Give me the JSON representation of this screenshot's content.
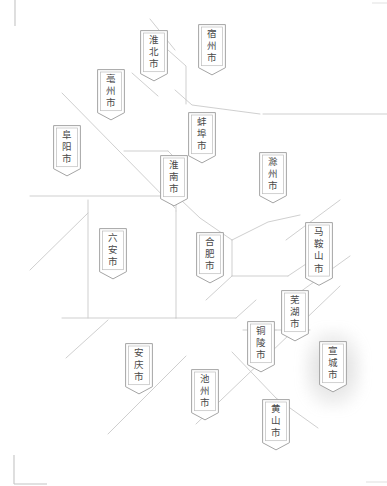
{
  "map": {
    "title": "安徽省",
    "region_name_en": "Anhui Province",
    "background_color": "#ffffff",
    "boundary_line_color": "#c9c9c9",
    "marker_border_color": "#9a9a9a",
    "marker_inner_border_color": "#bdbdbd",
    "marker_fill_color": "#ffffff",
    "label_text_color": "#4a4a4a",
    "highlight_glow_color": "#8a8a8a",
    "crop_mark_color": "#c4c4c4",
    "width": 387,
    "height": 486
  },
  "cities": [
    {
      "id": "huaibei",
      "label": "淮\n北\n市",
      "chars": 3,
      "x": 140,
      "y": 30,
      "highlighted": false
    },
    {
      "id": "suzhou",
      "label": "宿\n州\n市",
      "chars": 3,
      "x": 198,
      "y": 24,
      "highlighted": false
    },
    {
      "id": "bozhou",
      "label": "亳\n州\n市",
      "chars": 3,
      "x": 97,
      "y": 69,
      "highlighted": false
    },
    {
      "id": "bengbu",
      "label": "蚌\n埠\n市",
      "chars": 3,
      "x": 188,
      "y": 112,
      "highlighted": false
    },
    {
      "id": "fuyang",
      "label": "阜\n阳\n市",
      "chars": 3,
      "x": 53,
      "y": 125,
      "highlighted": false
    },
    {
      "id": "chuzhou",
      "label": "滁\n州\n市",
      "chars": 3,
      "x": 259,
      "y": 152,
      "highlighted": false
    },
    {
      "id": "huainan",
      "label": "淮\n南\n市",
      "chars": 3,
      "x": 160,
      "y": 155,
      "highlighted": false
    },
    {
      "id": "maanshan",
      "label": "马\n鞍\n山\n市",
      "chars": 4,
      "x": 305,
      "y": 222,
      "highlighted": false
    },
    {
      "id": "luan",
      "label": "六\n安\n市",
      "chars": 3,
      "x": 99,
      "y": 228,
      "highlighted": false
    },
    {
      "id": "hefei",
      "label": "合\n肥\n市",
      "chars": 3,
      "x": 196,
      "y": 232,
      "highlighted": false
    },
    {
      "id": "wuhu",
      "label": "芜\n湖\n市",
      "chars": 3,
      "x": 281,
      "y": 290,
      "highlighted": false
    },
    {
      "id": "tongling",
      "label": "铜\n陵\n市",
      "chars": 3,
      "x": 247,
      "y": 321,
      "highlighted": false
    },
    {
      "id": "anqing",
      "label": "安\n庆\n市",
      "chars": 3,
      "x": 125,
      "y": 343,
      "highlighted": false
    },
    {
      "id": "xuancheng",
      "label": "宣\n城\n市",
      "chars": 3,
      "x": 319,
      "y": 341,
      "highlighted": true
    },
    {
      "id": "chizhou",
      "label": "池\n州\n市",
      "chars": 3,
      "x": 191,
      "y": 369,
      "highlighted": false
    },
    {
      "id": "huangshan",
      "label": "黄\n山\n市",
      "chars": 3,
      "x": 262,
      "y": 399,
      "highlighted": false
    }
  ],
  "boundaries": [
    "M 150 19 L 175 50",
    "M 168 50 L 186 66 L 186 104",
    "M 175 90 L 192 105 L 260 114",
    "M 263 114 L 387 114",
    "M 62 93 L 175 208",
    "M 132 73 L 158 96",
    "M 124 151 L 168 151",
    "M 168 151 L 186 169",
    "M 30 196 L 176 196",
    "M 176 196 L 176 211",
    "M 181 200 L 200 218 L 232 240",
    "M 88 200 L 88 318",
    "M 176 211 L 176 318",
    "M 30 270 L 88 213",
    "M 232 240 L 268 222 L 300 215",
    "M 232 240 L 232 276",
    "M 232 276 L 288 276",
    "M 232 276 L 206 300",
    "M 176 318 L 236 318",
    "M 62 318 L 176 318",
    "M 236 318 L 256 300",
    "M 243 330 L 276 330",
    "M 276 330 L 310 330",
    "M 288 276 L 330 248",
    "M 196 424 L 340 286",
    "M 232 352 L 276 398",
    "M 276 398 L 318 428",
    "M 66 358 L 108 320",
    "M 108 434 L 186 356",
    "M 286 240 L 340 200",
    "M 300 292 L 350 256"
  ],
  "crop_marks": {
    "top_left_vertical": {
      "x": 15,
      "y1": 0,
      "y2": 26
    },
    "top_right_tick": {
      "x1": 372,
      "x2": 387,
      "y": 3
    },
    "bottom_left_corner": {
      "x": 14,
      "y1": 455,
      "y2": 484,
      "x2": 47
    },
    "bottom_right_tick": {
      "x1": 366,
      "x2": 387,
      "y": 482
    }
  }
}
